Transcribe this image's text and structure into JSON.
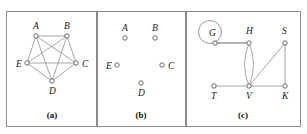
{
  "figure": {
    "background": "#ffffff",
    "border_color": "#8c8c8c",
    "edge_color": "#8f8f8f",
    "node_fill": "#ffffff",
    "node_stroke": "#5a5a5a",
    "label_color": "#1a1a1a"
  },
  "panels": [
    {
      "id": "a",
      "caption": "(a)",
      "caption_x": 52,
      "caption_y": 118,
      "frame": {
        "x": 6.5,
        "y": 11.5,
        "w": 90,
        "h": 115
      },
      "description": "complete graph on five vertices",
      "vertices": [
        {
          "id": "A",
          "label": "A",
          "x": 36,
          "y": 36,
          "r": 2.2,
          "label_x": 33,
          "label_y": 29
        },
        {
          "id": "B",
          "label": "B",
          "x": 67,
          "y": 36,
          "r": 2.2,
          "label_x": 64,
          "label_y": 29
        },
        {
          "id": "C",
          "label": "C",
          "x": 76,
          "y": 63,
          "r": 2.2,
          "label_x": 82,
          "label_y": 67
        },
        {
          "id": "D",
          "label": "D",
          "x": 52,
          "y": 81,
          "r": 2.2,
          "label_x": 49,
          "label_y": 94
        },
        {
          "id": "E",
          "label": "E",
          "x": 27,
          "y": 63,
          "r": 2.2,
          "label_x": 16,
          "label_y": 67
        }
      ],
      "edges": [
        {
          "from": "A",
          "to": "B"
        },
        {
          "from": "A",
          "to": "C"
        },
        {
          "from": "A",
          "to": "D"
        },
        {
          "from": "A",
          "to": "E"
        },
        {
          "from": "B",
          "to": "C"
        },
        {
          "from": "B",
          "to": "D"
        },
        {
          "from": "B",
          "to": "E"
        },
        {
          "from": "C",
          "to": "D"
        },
        {
          "from": "C",
          "to": "E"
        },
        {
          "from": "D",
          "to": "E"
        }
      ]
    },
    {
      "id": "b",
      "caption": "(b)",
      "caption_x": 141,
      "caption_y": 118,
      "frame": {
        "x": 97.5,
        "y": 11.5,
        "w": 88,
        "h": 115
      },
      "description": "five isolated vertices, no edges",
      "vertices": [
        {
          "id": "A",
          "label": "A",
          "x": 125,
          "y": 38,
          "r": 2.2,
          "label_x": 122,
          "label_y": 31
        },
        {
          "id": "B",
          "label": "B",
          "x": 155,
          "y": 38,
          "r": 2.2,
          "label_x": 152,
          "label_y": 31
        },
        {
          "id": "C",
          "label": "C",
          "x": 162,
          "y": 65,
          "r": 2.2,
          "label_x": 168,
          "label_y": 69
        },
        {
          "id": "D",
          "label": "D",
          "x": 141,
          "y": 83,
          "r": 2.2,
          "label_x": 138,
          "label_y": 96
        },
        {
          "id": "E",
          "label": "E",
          "x": 117,
          "y": 65,
          "r": 2.2,
          "label_x": 106,
          "label_y": 69
        }
      ],
      "edges": []
    },
    {
      "id": "c",
      "caption": "(c)",
      "caption_x": 243,
      "caption_y": 118,
      "frame": {
        "x": 186.5,
        "y": 11.5,
        "w": 114,
        "h": 115
      },
      "description": "multigraph with a loop at G and parallel edges between H and V",
      "vertices": [
        {
          "id": "G",
          "label": "G",
          "x": 215,
          "y": 43,
          "r": 2.2,
          "label_x": 209,
          "label_y": 36
        },
        {
          "id": "H",
          "label": "H",
          "x": 249,
          "y": 43,
          "r": 2.2,
          "label_x": 246,
          "label_y": 34
        },
        {
          "id": "S",
          "label": "S",
          "x": 285,
          "y": 43,
          "r": 2.2,
          "label_x": 282,
          "label_y": 34
        },
        {
          "id": "T",
          "label": "T",
          "x": 214,
          "y": 86,
          "r": 2.2,
          "label_x": 211,
          "label_y": 99
        },
        {
          "id": "V",
          "label": "V",
          "x": 249,
          "y": 86,
          "r": 2.2,
          "label_x": 246,
          "label_y": 99
        },
        {
          "id": "K",
          "label": "K",
          "x": 285,
          "y": 86,
          "r": 2.2,
          "label_x": 282,
          "label_y": 99
        }
      ],
      "edges": [
        {
          "from": "G",
          "to": "H",
          "style": "thick"
        },
        {
          "from": "T",
          "to": "V"
        },
        {
          "from": "V",
          "to": "K"
        },
        {
          "from": "S",
          "to": "K"
        },
        {
          "from": "S",
          "to": "V"
        },
        {
          "from": "H",
          "to": "V",
          "curve": -9
        },
        {
          "from": "H",
          "to": "V",
          "curve": 9
        }
      ],
      "loops": [
        {
          "at": "G",
          "cx": 210,
          "cy": 32,
          "r": 11.5
        }
      ]
    }
  ]
}
